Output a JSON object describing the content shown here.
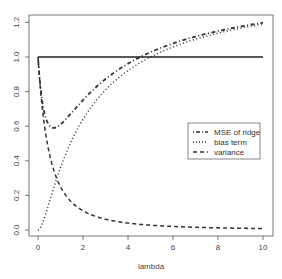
{
  "chart_data": {
    "type": "line",
    "title": "",
    "xlabel": "lambda",
    "ylabel": "",
    "xlim": [
      0,
      10
    ],
    "ylim": [
      0.0,
      1.25
    ],
    "x_ticks": [
      "0",
      "2",
      "4",
      "6",
      "8",
      "10"
    ],
    "y_ticks": [
      "0.0",
      "0.2",
      "0.4",
      "0.6",
      "0.8",
      "1.0",
      "1.2"
    ],
    "grid": false,
    "legend_position": "right-middle",
    "x": [
      0,
      0.25,
      0.5,
      0.75,
      1,
      1.5,
      2,
      3,
      4,
      5,
      6,
      7,
      8,
      9,
      10
    ],
    "series": [
      {
        "name": "MSE of ridge",
        "style": "dotdash",
        "values": [
          1.0,
          0.73,
          0.6,
          0.6,
          0.61,
          0.68,
          0.75,
          0.87,
          0.96,
          1.03,
          1.08,
          1.12,
          1.15,
          1.17,
          1.2
        ]
      },
      {
        "name": "bias term",
        "style": "dotted",
        "values": [
          0.0,
          0.06,
          0.16,
          0.26,
          0.36,
          0.52,
          0.64,
          0.81,
          0.92,
          1.0,
          1.06,
          1.1,
          1.14,
          1.17,
          1.19
        ]
      },
      {
        "name": "variance",
        "style": "dashed",
        "values": [
          1.0,
          0.64,
          0.44,
          0.33,
          0.25,
          0.16,
          0.11,
          0.06,
          0.04,
          0.03,
          0.02,
          0.016,
          0.012,
          0.01,
          0.008
        ]
      },
      {
        "name": "OLS MSE reference",
        "style": "solid",
        "values": [
          1.0,
          1.0,
          1.0,
          1.0,
          1.0,
          1.0,
          1.0,
          1.0,
          1.0,
          1.0,
          1.0,
          1.0,
          1.0,
          1.0,
          1.0
        ]
      }
    ]
  },
  "legend": {
    "items": [
      {
        "label": "MSE of ridge"
      },
      {
        "label": "bias term"
      },
      {
        "label": "variance"
      }
    ]
  },
  "axes": {
    "xlabel": "lambda",
    "x_ticks": [
      "0",
      "2",
      "4",
      "6",
      "8",
      "10"
    ],
    "y_ticks": [
      "0.0",
      "0.2",
      "0.4",
      "0.6",
      "0.8",
      "1.0",
      "1.2"
    ]
  }
}
